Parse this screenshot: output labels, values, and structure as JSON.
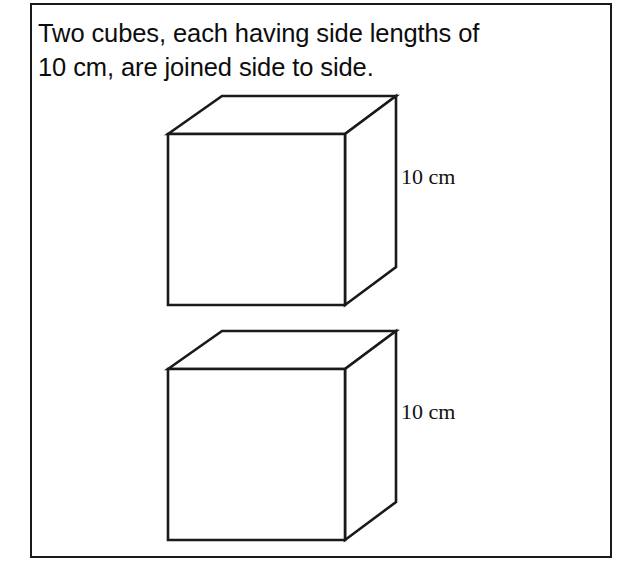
{
  "figure": {
    "frame": {
      "border_color": "#1a1a1a",
      "background_color": "#ffffff"
    },
    "problem_statement": "Two cubes, each having side lengths of\n10 cm, are joined side to side.",
    "statement_lines": [
      "Two cubes, each having side lengths of",
      "10 cm, are joined side to side."
    ],
    "cubes": [
      {
        "id": "cube-top",
        "dimension_label": "10 cm",
        "side_length": "10 cm"
      },
      {
        "id": "cube-bottom",
        "dimension_label": "10 cm",
        "side_length": "10 cm"
      }
    ],
    "line_color": "#1a1a1a",
    "fill_color": "#ffffff"
  }
}
